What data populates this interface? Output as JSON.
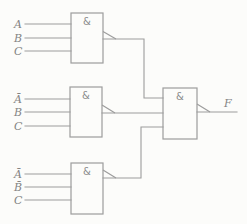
{
  "colors": {
    "background": "#fcfcfa",
    "wire": "#9c9c9c",
    "label": "#848484"
  },
  "circuit": {
    "gates": [
      {
        "name": "and-gate-top",
        "symbol": "&",
        "inputs": [
          "A",
          "B",
          "C"
        ],
        "output_negated": true
      },
      {
        "name": "and-gate-middle",
        "symbol": "&",
        "inputs": [
          "Ā",
          "B",
          "C"
        ],
        "output_negated": true
      },
      {
        "name": "and-gate-bottom",
        "symbol": "&",
        "inputs": [
          "Ā",
          "B̄",
          "C"
        ],
        "output_negated": true
      },
      {
        "name": "and-gate-output",
        "symbol": "&",
        "inputs": [],
        "output_negated": true
      }
    ],
    "output_label": "F"
  }
}
